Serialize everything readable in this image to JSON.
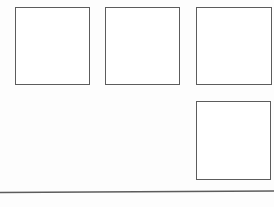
{
  "canvas": {
    "width": 274,
    "height": 207,
    "background_color": "#fdfdfd",
    "description": "Blank wireframe sketch with four empty rectangular outlines and one horizontal rule"
  },
  "style": {
    "stroke_color": "#5c5c5c",
    "stroke_width": 1.5,
    "fill_color": "#ffffff"
  },
  "shapes": {
    "boxes": [
      {
        "id": "box-1",
        "label": "",
        "x": 15,
        "y": 7,
        "width": 75,
        "height": 78,
        "row": 1,
        "column": 1
      },
      {
        "id": "box-2",
        "label": "",
        "x": 105,
        "y": 7,
        "width": 75,
        "height": 78,
        "row": 1,
        "column": 2
      },
      {
        "id": "box-3",
        "label": "",
        "x": 196,
        "y": 7,
        "width": 76,
        "height": 78,
        "row": 1,
        "column": 3
      },
      {
        "id": "box-4",
        "label": "",
        "x": 196,
        "y": 101,
        "width": 75,
        "height": 79,
        "row": 2,
        "column": 3
      }
    ],
    "rules": [
      {
        "id": "baseline",
        "label": "",
        "x1": 0,
        "y1": 6.5,
        "x2": 274,
        "y2": 5.0,
        "stroke_color": "#5c5c5c",
        "stroke_width": 1.4
      }
    ]
  },
  "empty_area": {
    "label": "",
    "x": 0,
    "y": 90,
    "width": 190,
    "height": 96
  }
}
